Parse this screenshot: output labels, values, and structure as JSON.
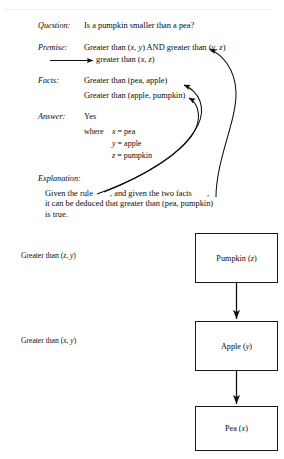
{
  "figure": {
    "caption_labels": {
      "question": "Question:",
      "premise": "Premise:",
      "facts": "Facts:",
      "answer": "Answer:",
      "explanation": "Explanation:"
    },
    "question": {
      "text": "Is a pumpkin smaller than a pea?"
    },
    "premise": {
      "line1_a": "Greater than (",
      "line1_x": "x",
      "line1_b": ", ",
      "line1_y": "y",
      "line1_c": ") AND greater than (",
      "line1_y2": "y",
      "line1_d": ", ",
      "line1_z": "z",
      "line1_e": ")",
      "line2_a": "greater than (",
      "line2_x": "x",
      "line2_b": ", ",
      "line2_z": "z",
      "line2_c": ")"
    },
    "facts": {
      "fact1": "Greater than (pea, apple)",
      "fact2": "Greater than (apple, pumpkin)"
    },
    "answer": {
      "value": "Yes",
      "where_keyword": "where",
      "bindings": [
        {
          "var": "x",
          "eq": "=",
          "value": "pea"
        },
        {
          "var": "y",
          "eq": "=",
          "value": "apple"
        },
        {
          "var": "z",
          "eq": "=",
          "value": "pumpkin"
        }
      ]
    },
    "explanation": {
      "line1_a": "Given the rule",
      "line1_b": ", and given the two facts",
      "line1_c": ",",
      "line2": "it can be deduced that greater than (pea, pumpkin)",
      "line3": "is true."
    },
    "diagram": {
      "edge_labels": [
        {
          "prefix": "Greater than (",
          "v1": "z",
          "sep": ", ",
          "v2": "y",
          "suffix": ")"
        },
        {
          "prefix": "Greater than (",
          "v1": "x",
          "sep": ", ",
          "v2": "y",
          "suffix": ")"
        }
      ],
      "nodes": [
        {
          "name": "Pumpkin (",
          "var": "z",
          "close": ")"
        },
        {
          "name": "Apple (",
          "var": "y",
          "close": ")"
        },
        {
          "name": "Pea (",
          "var": "x",
          "close": ")"
        }
      ]
    },
    "colors": {
      "ink": "#0a0a0a",
      "box_border": "#1b1b1b",
      "paper": "#ffffff",
      "artifact": "#ededed"
    }
  }
}
